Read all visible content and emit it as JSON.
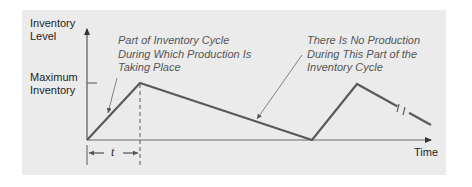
{
  "diagram": {
    "type": "inventory-level-over-time",
    "y_axis_label": [
      "Inventory",
      "Level"
    ],
    "x_axis_label": "Time",
    "max_label": [
      "Maximum",
      "Inventory"
    ],
    "t_label": "t",
    "annotations": [
      {
        "id": "production",
        "lines": [
          "Part of Inventory Cycle",
          "During Which Production Is",
          "Taking Place"
        ]
      },
      {
        "id": "no-production",
        "lines": [
          "There Is No Production",
          "During This Part of the",
          "Inventory Cycle"
        ]
      }
    ],
    "colors": {
      "panel_bg": "#ebebeb",
      "line": "#5a5a5a",
      "axis": "#6a6a6a",
      "annotation_text": "#555555",
      "label_text": "#1e1e1e"
    },
    "polyline_points": [
      [
        87,
        140
      ],
      [
        140,
        83
      ],
      [
        312,
        140
      ],
      [
        357,
        84
      ],
      [
        431,
        125
      ]
    ]
  }
}
